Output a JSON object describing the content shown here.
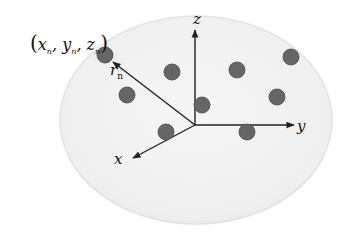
{
  "diagram": {
    "colors": {
      "background": "#ffffff",
      "sphere_fill": "#f1f1f1",
      "sphere_edge": "#e2e2e2",
      "point_fill": "#666666",
      "point_stroke": "#4a4a4a",
      "axis": "#222222"
    },
    "sphere": {
      "cx": 196,
      "cy": 120,
      "rx": 136,
      "ry": 104
    },
    "origin": {
      "x": 195,
      "y": 125
    },
    "axes": [
      {
        "name": "z",
        "label": "z",
        "x2": 195,
        "y2": 30,
        "label_x": 193,
        "label_y": 24
      },
      {
        "name": "y",
        "label": "y",
        "x2": 294,
        "y2": 125,
        "label_x": 297,
        "label_y": 131
      },
      {
        "name": "x",
        "label": "x",
        "x2": 133,
        "y2": 158,
        "label_x": 114,
        "label_y": 164
      }
    ],
    "radius_vector": {
      "label": "r",
      "subscript": "n",
      "x2": 113,
      "y2": 62,
      "label_x": 110,
      "label_y": 75
    },
    "point_label": {
      "text": "(x_n, y_n, z_n)",
      "parts": [
        "(",
        "x",
        "n",
        ", ",
        "y",
        "n",
        ", ",
        "z",
        "n",
        ")"
      ]
    },
    "points": [
      {
        "x": 105,
        "y": 55
      },
      {
        "x": 127,
        "y": 95
      },
      {
        "x": 172,
        "y": 72
      },
      {
        "x": 237,
        "y": 70
      },
      {
        "x": 291,
        "y": 57
      },
      {
        "x": 202,
        "y": 105
      },
      {
        "x": 166,
        "y": 132
      },
      {
        "x": 277,
        "y": 97
      },
      {
        "x": 247,
        "y": 132
      }
    ],
    "point_radius": 8
  }
}
